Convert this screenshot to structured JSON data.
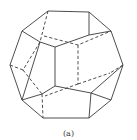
{
  "figure": {
    "caption": "(a)",
    "line_color": "#3a3a3a",
    "background": "#ffffff"
  }
}
